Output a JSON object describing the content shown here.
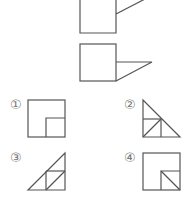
{
  "colors": {
    "stroke": "#555555",
    "label": "#777777",
    "background": "#ffffff"
  },
  "question": {
    "figure_top": "square with a line attached to its right edge",
    "figure_bottom": "square with a right triangle attached to its right edge"
  },
  "options": [
    {
      "number": "①",
      "description": "square with small square in bottom-right corner"
    },
    {
      "number": "②",
      "description": "right triangle subdivided with inner square and diagonal"
    },
    {
      "number": "③",
      "description": "right triangle subdivided with inner square and diagonal"
    },
    {
      "number": "④",
      "description": "square with small square in bottom-right corner split by diagonal"
    }
  ]
}
